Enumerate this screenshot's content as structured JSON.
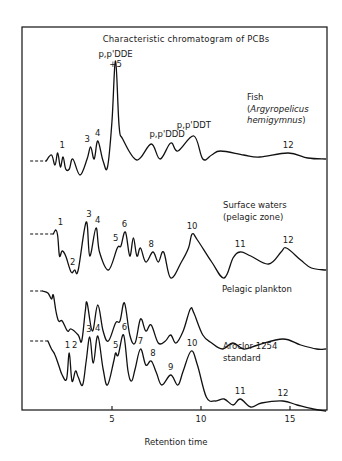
{
  "chart_data": {
    "type": "line",
    "title": "Characteristic chromatogram of PCBs",
    "xlabel": "Retention time",
    "ylabel": "",
    "xlim": [
      0,
      17
    ],
    "x_ticks": [
      5,
      10,
      15
    ],
    "x_tick_labels": [
      "5",
      "10",
      "15"
    ],
    "grid": false,
    "legend": "none (inline trace labels)",
    "series": [
      {
        "name": "Fish (Argyropelicus hemigymnus)",
        "label_lines": [
          "Fish",
          "(Argyropelicus",
          "hemigymnus)"
        ],
        "peak_labels": [
          {
            "text": "1",
            "x": 2.2
          },
          {
            "text": "3",
            "x": 3.6
          },
          {
            "text": "4",
            "x": 4.2
          },
          {
            "text": "p,p'DDE",
            "x": 5.2
          },
          {
            "text": "+5",
            "x": 5.2
          },
          {
            "text": "p,p'DDD",
            "x": 8.1
          },
          {
            "text": "p,p'DDT",
            "x": 9.6
          },
          {
            "text": "12",
            "x": 14.9
          }
        ],
        "points": [
          [
            0.4,
            0
          ],
          [
            1.3,
            0
          ],
          [
            1.6,
            -6
          ],
          [
            1.8,
            4
          ],
          [
            1.95,
            -8
          ],
          [
            2.1,
            6
          ],
          [
            2.25,
            -4
          ],
          [
            2.4,
            8
          ],
          [
            2.6,
            8
          ],
          [
            2.8,
            -2
          ],
          [
            3.2,
            14
          ],
          [
            3.6,
            -2
          ],
          [
            3.8,
            -14
          ],
          [
            4.0,
            -2
          ],
          [
            4.2,
            -20
          ],
          [
            4.5,
            0
          ],
          [
            4.75,
            6
          ],
          [
            5.0,
            -40
          ],
          [
            5.2,
            -100
          ],
          [
            5.4,
            -35
          ],
          [
            5.6,
            -22
          ],
          [
            6.4,
            -1
          ],
          [
            7.2,
            -17
          ],
          [
            7.7,
            -2
          ],
          [
            8.3,
            -18
          ],
          [
            8.7,
            -10
          ],
          [
            9.6,
            -25
          ],
          [
            10.1,
            -2
          ],
          [
            10.6,
            -6
          ],
          [
            11.1,
            -10
          ],
          [
            12.4,
            -6
          ],
          [
            13.3,
            -4
          ],
          [
            14.9,
            -8
          ],
          [
            16.0,
            -3
          ],
          [
            17.0,
            -2
          ]
        ]
      },
      {
        "name": "Surface waters (pelagic zone)",
        "label_lines": [
          "Surface waters",
          "(pelagic zone)"
        ],
        "peak_labels": [
          {
            "text": "1",
            "x": 2.1
          },
          {
            "text": "2",
            "x": 2.8
          },
          {
            "text": "3",
            "x": 3.7
          },
          {
            "text": "4",
            "x": 4.2
          },
          {
            "text": "5",
            "x": 5.2
          },
          {
            "text": "6",
            "x": 5.7
          },
          {
            "text": "8",
            "x": 7.2
          },
          {
            "text": "10",
            "x": 9.5
          },
          {
            "text": "11",
            "x": 12.2
          },
          {
            "text": "12",
            "x": 14.9
          }
        ],
        "points": [
          [
            0.4,
            0
          ],
          [
            1.7,
            0
          ],
          [
            1.85,
            -4
          ],
          [
            1.95,
            2
          ],
          [
            2.05,
            22
          ],
          [
            2.2,
            17
          ],
          [
            2.4,
            22
          ],
          [
            2.7,
            38
          ],
          [
            2.9,
            36
          ],
          [
            3.1,
            36
          ],
          [
            3.55,
            -12
          ],
          [
            3.75,
            22
          ],
          [
            4.1,
            -6
          ],
          [
            4.3,
            18
          ],
          [
            4.8,
            36
          ],
          [
            5.3,
            14
          ],
          [
            5.5,
            12
          ],
          [
            5.75,
            -2
          ],
          [
            6.0,
            22
          ],
          [
            6.2,
            4
          ],
          [
            6.4,
            22
          ],
          [
            6.6,
            14
          ],
          [
            6.9,
            28
          ],
          [
            7.3,
            18
          ],
          [
            7.6,
            28
          ],
          [
            7.9,
            18
          ],
          [
            8.3,
            44
          ],
          [
            8.9,
            28
          ],
          [
            9.3,
            14
          ],
          [
            9.5,
            0
          ],
          [
            9.8,
            6
          ],
          [
            10.6,
            28
          ],
          [
            11.3,
            44
          ],
          [
            11.8,
            24
          ],
          [
            12.2,
            18
          ],
          [
            12.8,
            22
          ],
          [
            13.8,
            30
          ],
          [
            14.5,
            18
          ],
          [
            14.8,
            14
          ],
          [
            15.6,
            26
          ],
          [
            16.2,
            34
          ],
          [
            17.0,
            36
          ]
        ]
      },
      {
        "name": "Pelagic plankton",
        "label_lines": [
          "Pelagic plankton"
        ],
        "peak_labels": [],
        "points": [
          [
            0.4,
            0
          ],
          [
            1.1,
            0
          ],
          [
            1.4,
            2
          ],
          [
            1.6,
            8
          ],
          [
            1.7,
            4
          ],
          [
            1.85,
            20
          ],
          [
            2.0,
            30
          ],
          [
            2.2,
            30
          ],
          [
            2.5,
            40
          ],
          [
            2.7,
            38
          ],
          [
            3.1,
            44
          ],
          [
            3.3,
            50
          ],
          [
            3.5,
            20
          ],
          [
            3.6,
            12
          ],
          [
            3.9,
            40
          ],
          [
            4.2,
            14
          ],
          [
            4.5,
            40
          ],
          [
            4.8,
            50
          ],
          [
            5.2,
            32
          ],
          [
            5.45,
            30
          ],
          [
            5.7,
            12
          ],
          [
            6.0,
            44
          ],
          [
            6.3,
            52
          ],
          [
            6.6,
            28
          ],
          [
            6.9,
            40
          ],
          [
            7.2,
            34
          ],
          [
            7.6,
            52
          ],
          [
            8.0,
            50
          ],
          [
            8.3,
            44
          ],
          [
            8.6,
            52
          ],
          [
            9.0,
            40
          ],
          [
            9.4,
            18
          ],
          [
            9.6,
            22
          ],
          [
            10.1,
            44
          ],
          [
            10.6,
            52
          ],
          [
            11.2,
            58
          ],
          [
            11.8,
            52
          ],
          [
            12.4,
            58
          ],
          [
            13.2,
            54
          ],
          [
            14.6,
            48
          ],
          [
            15.6,
            54
          ],
          [
            16.5,
            58
          ],
          [
            17.0,
            58
          ]
        ]
      },
      {
        "name": "Aroclor 1254 standard",
        "label_lines": [
          "Aroclor 1254",
          "standard"
        ],
        "peak_labels": [
          {
            "text": "1",
            "x": 2.5
          },
          {
            "text": "2",
            "x": 2.9
          },
          {
            "text": "3",
            "x": 3.7
          },
          {
            "text": "4",
            "x": 4.2
          },
          {
            "text": "5",
            "x": 5.2
          },
          {
            "text": "6",
            "x": 5.7
          },
          {
            "text": "7",
            "x": 6.6
          },
          {
            "text": "8",
            "x": 7.3
          },
          {
            "text": "9",
            "x": 8.3
          },
          {
            "text": "10",
            "x": 9.5
          },
          {
            "text": "11",
            "x": 12.2
          },
          {
            "text": "12",
            "x": 14.6
          }
        ],
        "points": [
          [
            0.4,
            0
          ],
          [
            1.4,
            0
          ],
          [
            1.6,
            8
          ],
          [
            1.8,
            14
          ],
          [
            2.0,
            24
          ],
          [
            2.2,
            34
          ],
          [
            2.45,
            38
          ],
          [
            2.6,
            12
          ],
          [
            2.75,
            40
          ],
          [
            2.95,
            30
          ],
          [
            3.1,
            36
          ],
          [
            3.35,
            44
          ],
          [
            3.55,
            20
          ],
          [
            3.75,
            -4
          ],
          [
            3.95,
            22
          ],
          [
            4.2,
            -5
          ],
          [
            4.5,
            28
          ],
          [
            4.75,
            44
          ],
          [
            5.1,
            20
          ],
          [
            5.2,
            12
          ],
          [
            5.35,
            14
          ],
          [
            5.65,
            -6
          ],
          [
            5.9,
            30
          ],
          [
            6.1,
            40
          ],
          [
            6.3,
            28
          ],
          [
            6.6,
            8
          ],
          [
            6.9,
            24
          ],
          [
            7.2,
            20
          ],
          [
            7.5,
            32
          ],
          [
            7.8,
            44
          ],
          [
            8.3,
            34
          ],
          [
            8.7,
            44
          ],
          [
            9.0,
            30
          ],
          [
            9.45,
            10
          ],
          [
            9.8,
            24
          ],
          [
            10.3,
            56
          ],
          [
            10.8,
            60
          ],
          [
            11.3,
            58
          ],
          [
            11.8,
            64
          ],
          [
            12.2,
            58
          ],
          [
            12.8,
            66
          ],
          [
            13.4,
            62
          ],
          [
            14.6,
            60
          ],
          [
            15.4,
            64
          ],
          [
            16.3,
            68
          ],
          [
            17.0,
            70
          ]
        ]
      }
    ]
  },
  "layout": {
    "frame": {
      "left": 22,
      "top": 27,
      "right": 327,
      "bottom": 410
    },
    "px_per_unit": 17.8,
    "x_origin_px": 23,
    "baselines_px": [
      161,
      234,
      291,
      341
    ]
  }
}
